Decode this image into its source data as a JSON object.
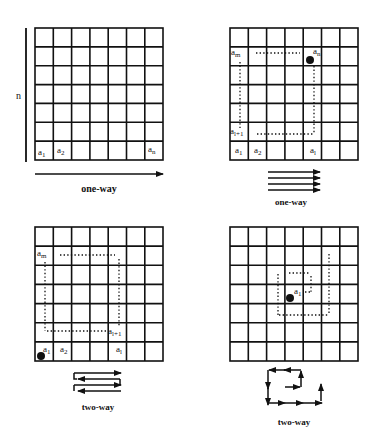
{
  "colors": {
    "ink": "#111111",
    "background": "#ffffff"
  },
  "panels": [
    {
      "id": "top-left",
      "side_label": "n",
      "cell_labels": [
        {
          "base": "a",
          "sub": "1"
        },
        {
          "base": "a",
          "sub": "2"
        },
        {
          "base": "a",
          "sub": "n"
        }
      ],
      "caption": "one-way"
    },
    {
      "id": "top-right",
      "cell_labels": [
        {
          "base": "a",
          "sub": "m"
        },
        {
          "base": "a",
          "sub": "n"
        },
        {
          "base": "a",
          "sub": "l+1"
        },
        {
          "base": "a",
          "sub": "1"
        },
        {
          "base": "a",
          "sub": "2"
        },
        {
          "base": "a",
          "sub": "l"
        }
      ],
      "caption": "one-way"
    },
    {
      "id": "bottom-left",
      "cell_labels": [
        {
          "base": "a",
          "sub": "m"
        },
        {
          "base": "a",
          "sub": "l+1"
        },
        {
          "base": "a",
          "sub": "1"
        },
        {
          "base": "a",
          "sub": "2"
        },
        {
          "base": "a",
          "sub": "l"
        }
      ],
      "caption": "two-way"
    },
    {
      "id": "bottom-right",
      "cell_labels": [
        {
          "base": "a",
          "sub": "1"
        }
      ],
      "caption": "two-way"
    }
  ],
  "grid": {
    "rows": 7,
    "cols": 7
  }
}
